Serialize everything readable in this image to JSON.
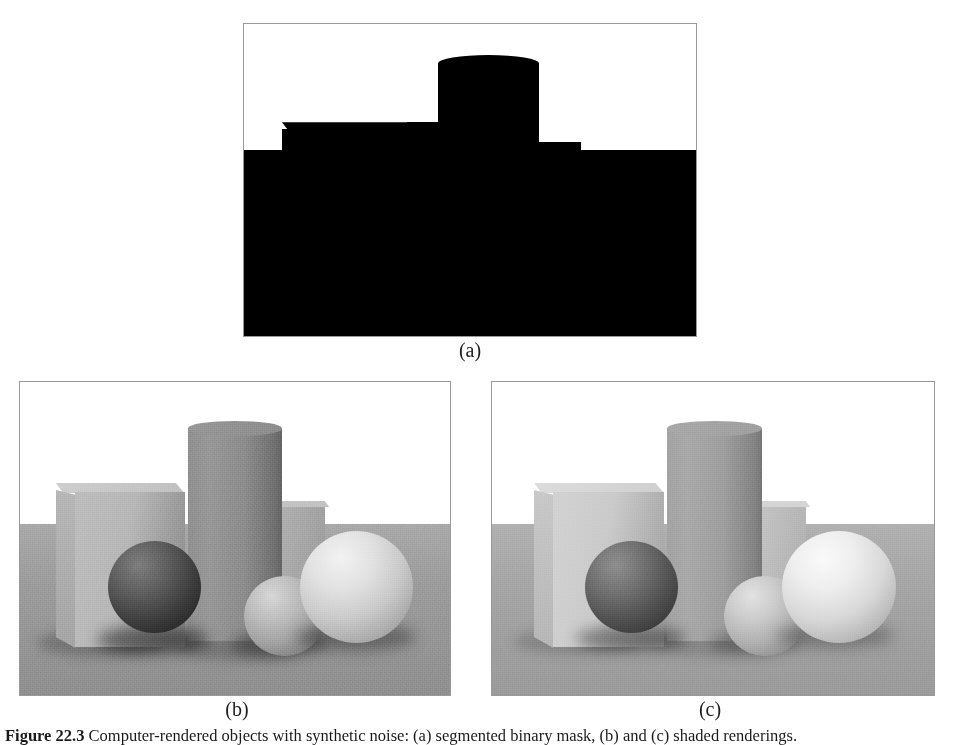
{
  "figure": {
    "caption_label": "Figure 22.3",
    "caption_text": "Computer-rendered objects with synthetic noise: (a) segmented binary mask, (b) and (c) shaded renderings.",
    "panels": [
      {
        "id": "a",
        "label": "(a)",
        "type": "binary-silhouette",
        "description": "Black silhouette mask of the scene on a white background",
        "colors": {
          "foreground": "#000000",
          "background": "#ffffff",
          "border": "#9a9a9a"
        },
        "objects": [
          "large-box",
          "tall-cylinder",
          "small-box",
          "ground-plane"
        ]
      },
      {
        "id": "b",
        "label": "(b)",
        "type": "shaded-rendering",
        "description": "Grayscale rendering of box, cylinder and three spheres on a ground plane with noise",
        "colors": {
          "sky": "#ffffff",
          "floor": "#9d9d9d",
          "box_front": "#b4b4b4",
          "box_side": "#a0a0a0",
          "box_top": "#c6c6c6",
          "cylinder": "#868686",
          "sphere_dark": "#4a4a4a",
          "sphere_mid": "#b2b2b2",
          "sphere_bright": "#e4e4e4",
          "border": "#9a9a9a"
        },
        "objects": [
          "large-box",
          "tall-cylinder",
          "small-box",
          "dark-sphere",
          "mid-sphere",
          "bright-sphere"
        ]
      },
      {
        "id": "c",
        "label": "(c)",
        "type": "shaded-rendering",
        "description": "Brighter grayscale rendering of the same scene with less noise",
        "colors": {
          "sky": "#ffffff",
          "floor": "#a6a6a6",
          "box_front": "#c8c8c8",
          "box_side": "#b6b6b6",
          "box_top": "#d6d6d6",
          "cylinder": "#9a9a9a",
          "sphere_dark": "#5c5c5c",
          "sphere_mid": "#c0c0c0",
          "sphere_bright": "#efefef",
          "border": "#9a9a9a"
        },
        "objects": [
          "large-box",
          "tall-cylinder",
          "small-box",
          "dark-sphere",
          "mid-sphere",
          "bright-sphere"
        ]
      }
    ]
  }
}
